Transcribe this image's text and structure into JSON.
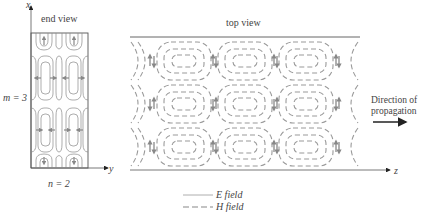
{
  "figure": {
    "end_view": {
      "title": "end view",
      "axis_vertical": "x",
      "axis_horizontal": "y",
      "m_label": "m = 3",
      "n_label": "n = 2"
    },
    "top_view": {
      "title": "top view",
      "axis_horizontal": "z",
      "propagation_line1": "Direction of",
      "propagation_line2": "propagation"
    },
    "legend": {
      "e_field": "E field",
      "h_field": "H field"
    },
    "colors": {
      "e_field": "#8a8a8a",
      "h_field": "#9a9a9a",
      "outline": "#555555",
      "arrow": "#222222"
    }
  }
}
